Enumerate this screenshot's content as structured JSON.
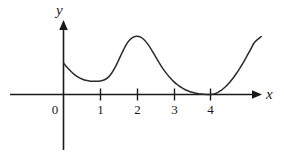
{
  "figure": {
    "background_color": "#ffffff",
    "ink_color": "#1a1a1a",
    "width": 284,
    "height": 160
  },
  "axes": {
    "x_axis_label": "x",
    "y_axis_label": "y",
    "origin_label": "0",
    "x_tick_labels": [
      "1",
      "2",
      "3",
      "4"
    ]
  },
  "chart_data": {
    "type": "line",
    "title": "",
    "xlabel": "x",
    "ylabel": "y",
    "grid": false,
    "legend": null,
    "xlim": [
      -1.4,
      5.3
    ],
    "ylim": [
      -1.6,
      2.2
    ],
    "x_ticks": [
      1,
      2,
      3,
      4
    ],
    "x_tick_labels": [
      "1",
      "2",
      "3",
      "4"
    ],
    "y_ticks": [],
    "y_tick_labels": [],
    "origin_label": "0",
    "annotations": [
      "curve touches the x-axis tangentially at x = 4 (double root)",
      "local minimum near x = 1.1",
      "local maximum near x = 2.0",
      "curve rises steeply for x > 4"
    ],
    "series": [
      {
        "name": "f(x)",
        "x": [
          0.0,
          0.1,
          0.2,
          0.3,
          0.4,
          0.5,
          0.6,
          0.7,
          0.8,
          0.9,
          1.0,
          1.1,
          1.2,
          1.3,
          1.4,
          1.5,
          1.6,
          1.7,
          1.8,
          1.9,
          2.0,
          2.1,
          2.2,
          2.3,
          2.4,
          2.5,
          2.6,
          2.7,
          2.8,
          2.9,
          3.0,
          3.1,
          3.2,
          3.3,
          3.4,
          3.5,
          3.6,
          3.7,
          3.8,
          3.9,
          4.0,
          4.1,
          4.2,
          4.3,
          4.4,
          4.5,
          4.6,
          4.7,
          4.8,
          4.9,
          5.0,
          5.1,
          5.2,
          5.38
        ],
        "y": [
          1.0,
          0.86,
          0.74,
          0.63,
          0.55,
          0.49,
          0.45,
          0.43,
          0.42,
          0.42,
          0.43,
          0.46,
          0.53,
          0.66,
          0.85,
          1.09,
          1.34,
          1.57,
          1.73,
          1.82,
          1.85,
          1.82,
          1.73,
          1.59,
          1.41,
          1.21,
          1.01,
          0.83,
          0.67,
          0.53,
          0.41,
          0.31,
          0.23,
          0.16,
          0.11,
          0.07,
          0.04,
          0.02,
          0.01,
          0.0,
          0.0,
          0.02,
          0.07,
          0.14,
          0.24,
          0.36,
          0.5,
          0.66,
          0.84,
          1.03,
          1.24,
          1.45,
          1.66,
          1.84
        ]
      }
    ]
  }
}
